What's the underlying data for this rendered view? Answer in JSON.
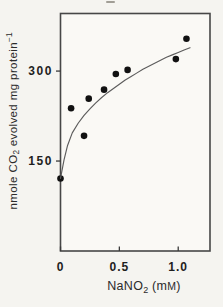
{
  "figure": {
    "background": "#f5f4f0",
    "plot_background": "#faf9f5",
    "frame_color": "#474747",
    "tick_color": "#3a3a3a",
    "curve_color": "#5c5c5c",
    "point_color": "#111111",
    "text_color": "#262626"
  },
  "chart_data": {
    "type": "scatter",
    "title": "",
    "xlabel": "NaNO₂ (mM)",
    "ylabel": "nmole CO₂ evolved mg protein⁻¹",
    "xlim": [
      0,
      1.27
    ],
    "ylim": [
      0,
      396
    ],
    "x_ticks": [
      0,
      0.5,
      1.0
    ],
    "x_tick_labels": [
      "0",
      "0.5",
      "1.0"
    ],
    "y_ticks": [
      150,
      300
    ],
    "y_tick_labels": [
      "150",
      "300"
    ],
    "grid": false,
    "legend": false,
    "series": [
      {
        "name": "measured CO2 evolution",
        "type": "scatter",
        "marker": "filled-circle",
        "marker_radius": 3.3,
        "points": [
          [
            0,
            121
          ],
          [
            0.09,
            238
          ],
          [
            0.2,
            192
          ],
          [
            0.24,
            254
          ],
          [
            0.37,
            269
          ],
          [
            0.47,
            295
          ],
          [
            0.57,
            302
          ],
          [
            0.98,
            320
          ],
          [
            1.07,
            354
          ]
        ]
      },
      {
        "name": "fitted saturation curve",
        "type": "line",
        "points": [
          [
            0,
            121
          ],
          [
            0.03,
            152
          ],
          [
            0.06,
            176
          ],
          [
            0.1,
            197
          ],
          [
            0.15,
            213
          ],
          [
            0.2,
            226
          ],
          [
            0.25,
            237
          ],
          [
            0.3,
            247
          ],
          [
            0.35,
            256
          ],
          [
            0.4,
            264
          ],
          [
            0.45,
            271
          ],
          [
            0.5,
            278
          ],
          [
            0.55,
            285
          ],
          [
            0.6,
            291
          ],
          [
            0.65,
            297
          ],
          [
            0.7,
            303
          ],
          [
            0.75,
            308
          ],
          [
            0.8,
            313
          ],
          [
            0.85,
            318
          ],
          [
            0.9,
            323
          ],
          [
            0.95,
            327
          ],
          [
            1.0,
            331
          ],
          [
            1.05,
            335
          ],
          [
            1.1,
            339
          ]
        ]
      }
    ]
  },
  "labels": {
    "ylabel_pre": "nmole CO",
    "ylabel_sub": "2",
    "ylabel_mid": " evolved mg protein",
    "ylabel_sup": "−1",
    "xlabel_pre": "NaNO",
    "xlabel_sub": "2",
    "xlabel_open": " (m",
    "xlabel_unit": "M",
    "xlabel_close": ")"
  }
}
